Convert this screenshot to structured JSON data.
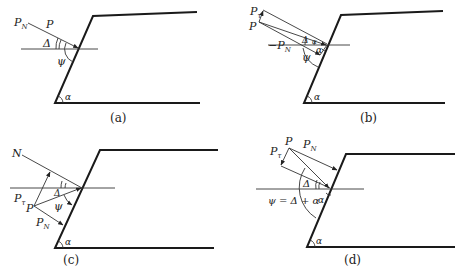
{
  "figure": {
    "panels": [
      {
        "id": "a",
        "caption": "(a)",
        "labels": {
          "pn": "P",
          "pn_sub": "N",
          "p": "P",
          "delta": "Δ",
          "psi": "ψ",
          "alpha": "α"
        }
      },
      {
        "id": "b",
        "caption": "(b)",
        "labels": {
          "pt": "P",
          "pt_sub": "τ",
          "p": "P",
          "neg_pn": "−P",
          "neg_pn_sub": "N",
          "delta": "Δ",
          "alpha_small": "α",
          "alpha_mid": "α",
          "psi": "ψ",
          "alpha": "α"
        }
      },
      {
        "id": "c",
        "caption": "(c)",
        "labels": {
          "n": "N",
          "pt": "P",
          "pt_sub": "τ",
          "p": "P",
          "pn": "P",
          "pn_sub": "N",
          "delta": "Δ",
          "psi": "ψ",
          "alpha": "α"
        }
      },
      {
        "id": "d",
        "caption": "(d)",
        "labels": {
          "p": "P",
          "pt": "P",
          "pt_sub": "τ",
          "pn": "P",
          "pn_sub": "N",
          "delta": "Δ",
          "equation": "ψ = Δ + α",
          "alpha_mid": "α",
          "alpha": "α"
        }
      }
    ]
  }
}
